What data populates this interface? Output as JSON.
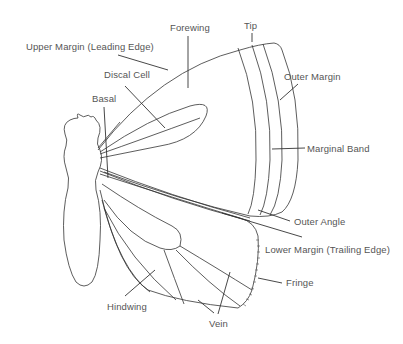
{
  "diagram": {
    "line_color": "#333333",
    "label_color": "#555555",
    "background": "#ffffff",
    "labels": {
      "forewing": "Forewing",
      "tip": "Tip",
      "upper_margin": "Upper Margin (Leading Edge)",
      "discal_cell": "Discal Cell",
      "outer_margin": "Outer Margin",
      "basal": "Basal",
      "marginal_band": "Marginal Band",
      "outer_angle": "Outer Angle",
      "lower_margin": "Lower Margin (Trailing Edge)",
      "fringe": "Fringe",
      "hindwing": "Hindwing",
      "vein": "Vein"
    }
  }
}
